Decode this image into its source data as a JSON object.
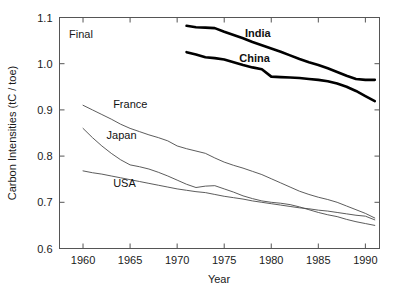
{
  "chart_data": {
    "type": "line",
    "title": "",
    "annotation": "Final",
    "xlabel": "Year",
    "ylabel": "Carbon Intensities (tC / toe)",
    "xlim": [
      1957.5,
      1991.5
    ],
    "ylim": [
      0.6,
      1.1
    ],
    "xticks": [
      1960,
      1965,
      1970,
      1975,
      1980,
      1985,
      1990
    ],
    "xtick_labels": [
      "1960",
      "1965",
      "1970",
      "1975",
      "1980",
      "1985",
      "1990"
    ],
    "yticks": [
      0.6,
      0.7,
      0.8,
      0.9,
      1.0,
      1.1
    ],
    "ytick_labels": [
      "0.6",
      "0.7",
      "0.8",
      "0.9",
      "1.0",
      "1.1"
    ],
    "grid": false,
    "legend": "inline-labels",
    "series": [
      {
        "name": "India",
        "style": "thick-black",
        "color": "#000000",
        "width": 2.6,
        "label_x": 1977.2,
        "label_y": 1.058,
        "label_bold": true,
        "x": [
          1971,
          1972,
          1973,
          1974,
          1975,
          1976,
          1977,
          1978,
          1979,
          1980,
          1981,
          1982,
          1983,
          1984,
          1985,
          1986,
          1987,
          1988,
          1989,
          1990,
          1991
        ],
        "y": [
          1.082,
          1.079,
          1.078,
          1.077,
          1.069,
          1.062,
          1.055,
          1.047,
          1.04,
          1.033,
          1.026,
          1.018,
          1.01,
          1.003,
          0.997,
          0.99,
          0.982,
          0.974,
          0.967,
          0.965,
          0.965
        ]
      },
      {
        "name": "China",
        "style": "thick-black",
        "color": "#000000",
        "width": 2.6,
        "label_x": 1976.6,
        "label_y": 1.003,
        "label_bold": true,
        "x": [
          1971,
          1972,
          1973,
          1974,
          1975,
          1976,
          1977,
          1978,
          1979,
          1980,
          1981,
          1982,
          1983,
          1984,
          1985,
          1986,
          1987,
          1988,
          1989,
          1990,
          1991
        ],
        "y": [
          1.025,
          1.02,
          1.014,
          1.012,
          1.009,
          1.003,
          0.997,
          0.992,
          0.988,
          0.972,
          0.971,
          0.97,
          0.969,
          0.967,
          0.965,
          0.962,
          0.957,
          0.95,
          0.941,
          0.93,
          0.919
        ]
      },
      {
        "name": "France",
        "style": "thin-gray",
        "color": "#4a4a4a",
        "width": 0.9,
        "label_x": 1963.2,
        "label_y": 0.905,
        "label_bold": false,
        "x": [
          1960,
          1961,
          1962,
          1963,
          1964,
          1965,
          1966,
          1967,
          1968,
          1969,
          1970,
          1971,
          1972,
          1973,
          1974,
          1975,
          1976,
          1977,
          1978,
          1979,
          1980,
          1981,
          1982,
          1983,
          1984,
          1985,
          1986,
          1987,
          1988,
          1989,
          1990,
          1991
        ],
        "y": [
          0.91,
          0.9,
          0.89,
          0.88,
          0.869,
          0.86,
          0.853,
          0.846,
          0.84,
          0.833,
          0.822,
          0.816,
          0.811,
          0.806,
          0.796,
          0.787,
          0.78,
          0.774,
          0.767,
          0.76,
          0.751,
          0.742,
          0.733,
          0.724,
          0.717,
          0.711,
          0.706,
          0.7,
          0.692,
          0.684,
          0.676,
          0.666
        ]
      },
      {
        "name": "Japan",
        "style": "thin-gray",
        "color": "#4a4a4a",
        "width": 0.9,
        "label_x": 1962.5,
        "label_y": 0.838,
        "label_bold": false,
        "x": [
          1960,
          1961,
          1962,
          1963,
          1964,
          1965,
          1966,
          1967,
          1968,
          1969,
          1970,
          1971,
          1972,
          1973,
          1974,
          1975,
          1976,
          1977,
          1978,
          1979,
          1980,
          1981,
          1982,
          1983,
          1984,
          1985,
          1986,
          1987,
          1988,
          1989,
          1990,
          1991
        ],
        "y": [
          0.86,
          0.84,
          0.822,
          0.806,
          0.792,
          0.781,
          0.777,
          0.772,
          0.765,
          0.757,
          0.748,
          0.739,
          0.732,
          0.735,
          0.736,
          0.729,
          0.722,
          0.714,
          0.708,
          0.703,
          0.7,
          0.698,
          0.695,
          0.69,
          0.684,
          0.678,
          0.673,
          0.669,
          0.663,
          0.658,
          0.654,
          0.65
        ]
      },
      {
        "name": "USA",
        "style": "thin-gray",
        "color": "#4a4a4a",
        "width": 0.9,
        "label_x": 1963.2,
        "label_y": 0.733,
        "label_bold": false,
        "x": [
          1960,
          1961,
          1962,
          1963,
          1964,
          1965,
          1966,
          1967,
          1968,
          1969,
          1970,
          1971,
          1972,
          1973,
          1974,
          1975,
          1976,
          1977,
          1978,
          1979,
          1980,
          1981,
          1982,
          1983,
          1984,
          1985,
          1986,
          1987,
          1988,
          1989,
          1990,
          1991
        ],
        "y": [
          0.768,
          0.764,
          0.761,
          0.757,
          0.753,
          0.749,
          0.745,
          0.741,
          0.737,
          0.733,
          0.729,
          0.726,
          0.723,
          0.721,
          0.717,
          0.713,
          0.71,
          0.707,
          0.703,
          0.7,
          0.697,
          0.694,
          0.691,
          0.688,
          0.686,
          0.683,
          0.681,
          0.678,
          0.675,
          0.672,
          0.67,
          0.662
        ]
      }
    ]
  }
}
